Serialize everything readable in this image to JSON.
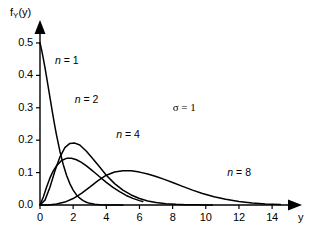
{
  "chart_data": {
    "type": "line",
    "title": "",
    "subtitle": "",
    "xlabel": "y",
    "ylabel": "f_Y(y)",
    "ylabel_main": "f",
    "ylabel_sub": "Y",
    "ylabel_arg": "(y)",
    "xlim": [
      0,
      15.2
    ],
    "ylim": [
      0,
      0.54
    ],
    "grid": false,
    "legend_position": "inline-annotations",
    "xticks": [
      0,
      2,
      4,
      6,
      8,
      10,
      12,
      14
    ],
    "xtick_labels": [
      "0",
      "2",
      "4",
      "6",
      "8",
      "10",
      "12",
      "14"
    ],
    "yticks": [
      0.0,
      0.1,
      0.2,
      0.3,
      0.4,
      0.5
    ],
    "ytick_labels": [
      "0.0",
      "0.1",
      "0.2",
      "0.3",
      "0.4",
      "0.5"
    ],
    "annotations": [
      {
        "name": "sigma-annotation",
        "text": "σ = 1",
        "x": 8.0,
        "y": 0.3
      }
    ],
    "series": [
      {
        "name": "n = 1",
        "label_n": "n",
        "label_eq": "= 1",
        "color": "#000000",
        "label_x": 0.9,
        "label_y": 0.445,
        "x": [
          0.0,
          0.1,
          0.2,
          0.3,
          0.4,
          0.5,
          0.6,
          0.7,
          0.8,
          0.9,
          1.0,
          1.2,
          1.4,
          1.6,
          1.8,
          2.0,
          2.2,
          2.4,
          2.6,
          2.8,
          3.0,
          3.3,
          3.6,
          4.0,
          4.4,
          5.0
        ],
        "y": [
          0.5,
          0.478,
          0.452,
          0.424,
          0.394,
          0.363,
          0.332,
          0.301,
          0.271,
          0.242,
          0.215,
          0.166,
          0.125,
          0.092,
          0.066,
          0.046,
          0.031,
          0.021,
          0.0135,
          0.0084,
          0.0051,
          0.0023,
          0.0009,
          0.0003,
          8e-05,
          1e-05
        ]
      },
      {
        "name": "n = 2",
        "label_n": "n",
        "label_eq": "= 2",
        "color": "#000000",
        "label_x": 2.1,
        "label_y": 0.325,
        "x": [
          0.0,
          0.2,
          0.4,
          0.6,
          0.8,
          1.0,
          1.3,
          1.6,
          1.9,
          2.2,
          2.5,
          2.8,
          3.1,
          3.4,
          3.7,
          4.0,
          4.4,
          4.8,
          5.2,
          5.6,
          6.0,
          6.2
        ],
        "y": [
          0.0,
          0.0245,
          0.0555,
          0.0835,
          0.1055,
          0.1215,
          0.1375,
          0.144,
          0.144,
          0.1395,
          0.1315,
          0.1205,
          0.1085,
          0.0955,
          0.0825,
          0.07,
          0.0545,
          0.041,
          0.0295,
          0.0205,
          0.0135,
          0.011
        ]
      },
      {
        "name": "n = 4",
        "label_n": "n",
        "label_eq": "= 4",
        "color": "#000000",
        "label_x": 4.6,
        "label_y": 0.215,
        "x": [
          0.0,
          0.3,
          0.6,
          0.9,
          1.2,
          1.5,
          1.8,
          2.1,
          2.4,
          2.8,
          3.2,
          3.6,
          4.0,
          4.5,
          5.0,
          5.5,
          6.0,
          6.5,
          7.0,
          7.6,
          8.2,
          8.8,
          9.4,
          10.0,
          10.4
        ],
        "y": [
          0.0,
          0.015,
          0.055,
          0.105,
          0.148,
          0.177,
          0.19,
          0.191,
          0.185,
          0.166,
          0.142,
          0.117,
          0.092,
          0.066,
          0.046,
          0.031,
          0.02,
          0.0125,
          0.0078,
          0.004,
          0.002,
          0.0009,
          0.0004,
          0.00015,
          8e-05
        ]
      },
      {
        "name": "n = 8",
        "label_n": "n",
        "label_eq": "= 8",
        "color": "#000000",
        "label_x": 11.3,
        "label_y": 0.098,
        "x": [
          0.0,
          0.5,
          1.0,
          1.5,
          2.0,
          2.5,
          3.0,
          3.5,
          4.0,
          4.5,
          5.0,
          5.5,
          6.0,
          6.5,
          7.0,
          7.5,
          8.0,
          8.6,
          9.2,
          9.8,
          10.5,
          11.2,
          12.0,
          12.8,
          13.6,
          14.5
        ],
        "y": [
          0.0,
          0.0,
          0.003,
          0.009,
          0.02,
          0.036,
          0.055,
          0.075,
          0.092,
          0.102,
          0.106,
          0.1055,
          0.1015,
          0.0955,
          0.088,
          0.079,
          0.0695,
          0.0575,
          0.046,
          0.0355,
          0.0255,
          0.0175,
          0.0105,
          0.006,
          0.0032,
          0.0014
        ]
      }
    ]
  },
  "figure": {
    "background": "#ffffff",
    "axis_color": "#000000",
    "curve_color": "#000000"
  }
}
